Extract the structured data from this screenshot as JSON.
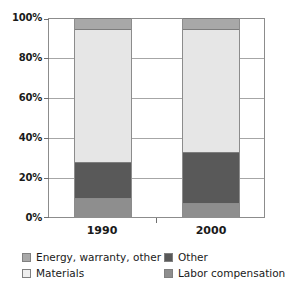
{
  "chart_data": {
    "type": "bar",
    "stacked": true,
    "title": "",
    "subtitle": "",
    "xlabel": "",
    "ylabel": "",
    "categories": [
      "1990",
      "2000"
    ],
    "ylim": [
      0,
      100
    ],
    "yticks": [
      0,
      20,
      40,
      60,
      80,
      100
    ],
    "ytick_labels": [
      "0%",
      "20%",
      "40%",
      "60%",
      "80%",
      "100%"
    ],
    "grid": true,
    "legend_position": "bottom",
    "stack_order_bottom_to_top": [
      "Labor compensation",
      "Other",
      "Materials",
      "Energy, warranty, other"
    ],
    "series": [
      {
        "name": "Labor compensation",
        "color": "#8e8e8e",
        "values": [
          10,
          7.5
        ]
      },
      {
        "name": "Other",
        "color": "#595959",
        "values": [
          18,
          25.5
        ]
      },
      {
        "name": "Materials",
        "color": "#e6e6e6",
        "values": [
          66.5,
          61.5
        ]
      },
      {
        "name": "Energy, warranty, other",
        "color": "#a8a8a8",
        "values": [
          5.5,
          5.5
        ]
      }
    ],
    "cumulative_boundaries": {
      "1990": [
        0,
        10,
        28,
        94.5,
        100
      ],
      "2000": [
        0,
        7.5,
        33,
        94.5,
        100
      ]
    }
  },
  "axis": {
    "y_ticks": [
      {
        "label": "100%",
        "value": 100
      },
      {
        "label": "80%",
        "value": 80
      },
      {
        "label": "60%",
        "value": 60
      },
      {
        "label": "40%",
        "value": 40
      },
      {
        "label": "20%",
        "value": 20
      },
      {
        "label": "0%",
        "value": 0
      }
    ],
    "x_ticks": [
      {
        "label": "1990"
      },
      {
        "label": "2000"
      }
    ]
  },
  "legend": {
    "entries": [
      {
        "label": "Energy, warranty, other",
        "color": "#a8a8a8"
      },
      {
        "label": "Other",
        "color": "#595959"
      },
      {
        "label": "Materials",
        "color": "#efefef"
      },
      {
        "label": "Labor compensation",
        "color": "#8e8e8e"
      }
    ]
  },
  "colors": {
    "energy": "#a8a8a8",
    "materials": "#e6e6e6",
    "other": "#595959",
    "labor": "#8e8e8e",
    "grid": "#a6a6a6",
    "frame": "#8c8c8c",
    "text": "#1a1a1a",
    "background": "#ffffff"
  }
}
